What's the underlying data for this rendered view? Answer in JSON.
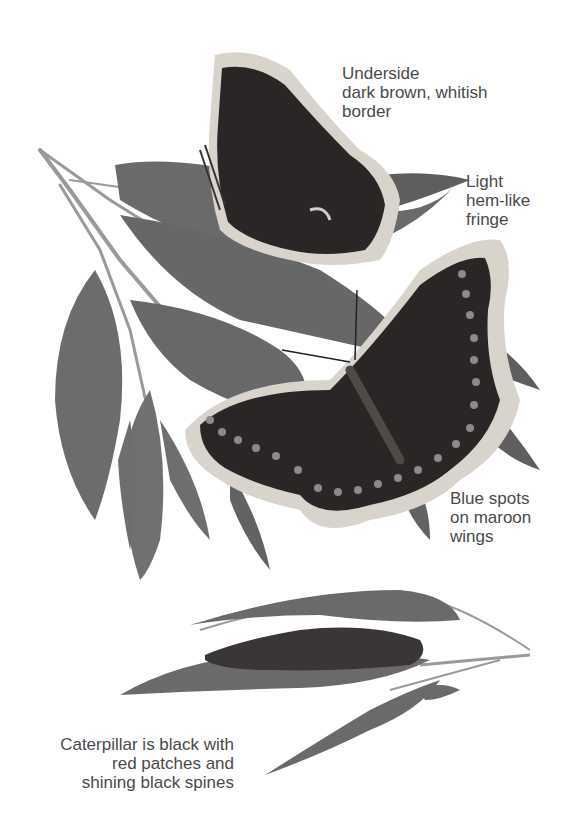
{
  "illustration": {
    "subject": "Mourning cloak butterfly and caterpillar on willow branches",
    "colors": {
      "background": "#ffffff",
      "label_text": "#4a4a4a",
      "leaf": "#6e6e6e",
      "leaf_dark": "#5a5a5a",
      "wing": "#2a2626",
      "wing_border": "#d8d4cc",
      "spot": "#8a8a8a",
      "stem": "#9a9a9a"
    }
  },
  "labels": {
    "underside": {
      "lines": [
        "Underside",
        "dark brown, whitish",
        "border"
      ]
    },
    "fringe": {
      "lines": [
        "Light",
        "hem-like",
        "fringe"
      ]
    },
    "spots": {
      "lines": [
        "Blue spots",
        "on maroon",
        "wings"
      ]
    },
    "caterpillar": {
      "lines": [
        "Caterpillar is black with",
        "red patches and",
        "shining black spines"
      ]
    }
  }
}
